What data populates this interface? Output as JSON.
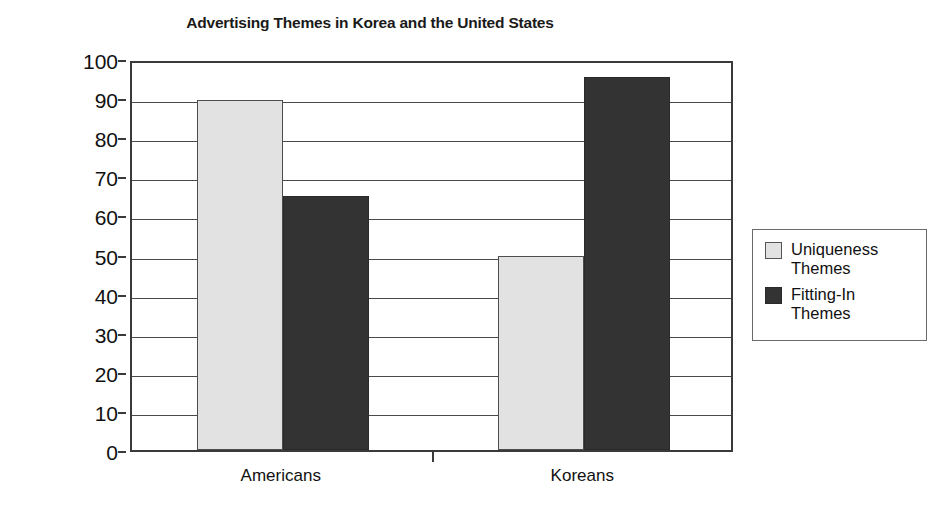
{
  "chart_data": {
    "type": "bar",
    "title": "Advertising Themes in Korea and the United States",
    "xlabel": "",
    "ylabel_line1": "Percentage of Ads",
    "ylabel_line2": "Containing Each Theme",
    "categories": [
      "Americans",
      "Koreans"
    ],
    "series": [
      {
        "name_line1": "Uniqueness",
        "name_line2": "Themes",
        "color": "#e2e2e2",
        "values": [
          89.5,
          49.5
        ]
      },
      {
        "name_line1": "Fitting-In",
        "name_line2": "Themes",
        "color": "#333333",
        "values": [
          65,
          95.5
        ]
      }
    ],
    "ylim": [
      0,
      100
    ],
    "yticks": [
      100,
      90,
      80,
      70,
      60,
      50,
      40,
      30,
      20,
      10,
      0
    ],
    "ytick_labels": [
      "100",
      "90",
      "80",
      "70",
      "60",
      "50",
      "40",
      "30",
      "20",
      "10",
      "0"
    ],
    "grid": true,
    "legend_position": "right"
  }
}
